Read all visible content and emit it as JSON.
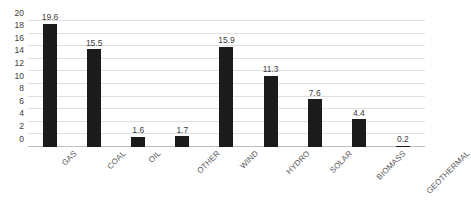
{
  "chart_data": {
    "type": "bar",
    "title": "",
    "subtitle": "",
    "xlabel": "",
    "ylabel": "",
    "ylim": [
      0,
      20
    ],
    "ytick_step": 2,
    "yticks": [
      "0",
      "2",
      "4",
      "6",
      "8",
      "10",
      "12",
      "14",
      "16",
      "18",
      "20"
    ],
    "grid": true,
    "legend": "none",
    "categories": [
      "GAS",
      "COAL",
      "OIL",
      "OTHER",
      "WIND",
      "HYDRO",
      "SOLAR",
      "BIOMASS",
      "GEOTHERMAL"
    ],
    "values": [
      19.6,
      15.5,
      1.6,
      1.7,
      15.9,
      11.3,
      7.6,
      4.4,
      0.2
    ],
    "data_labels": [
      "19.6",
      "15.5",
      "1.6",
      "1.7",
      "15.9",
      "11.3",
      "7.6",
      "4.4",
      "0.2"
    ],
    "bar_color": "#1b1b1b",
    "gridline_color": "#e0e0e0",
    "axis_color": "#bfbfbf",
    "label_color": "#3d3d3d",
    "category_label_color": "#5a5a5a",
    "background_color": "#ffffff"
  }
}
